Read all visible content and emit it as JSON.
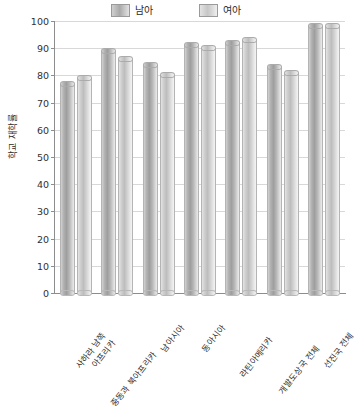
{
  "chart_data": {
    "type": "bar",
    "title": "",
    "xlabel": "",
    "ylabel": "학교 재학률",
    "ylim": [
      0,
      100
    ],
    "yticks": [
      0,
      10,
      20,
      30,
      40,
      50,
      60,
      70,
      80,
      90,
      100
    ],
    "grid": true,
    "legend_position": "top-center",
    "categories": [
      "사하라 남쪽 아프리카",
      "중동과 북아프리카",
      "남아시아",
      "동아시아",
      "라틴아메리카",
      "개발도상국 전체",
      "선진국 전체"
    ],
    "category_lines": [
      [
        "사하라 남쪽",
        "아프리카"
      ],
      [
        "중동과 북아프리카",
        ""
      ],
      [
        "남아시아",
        ""
      ],
      [
        "동아시아",
        ""
      ],
      [
        "라틴아메리카",
        ""
      ],
      [
        "개발도상국 전체",
        ""
      ],
      [
        "선진국 전체",
        ""
      ]
    ],
    "series": [
      {
        "name": "남아",
        "color": "#a9a9a9",
        "values": [
          77,
          89,
          84,
          91,
          92,
          83,
          98
        ]
      },
      {
        "name": "여아",
        "color": "#cdcdcd",
        "values": [
          79,
          86,
          80,
          90,
          93,
          81,
          98
        ]
      }
    ]
  },
  "legend": {
    "items": [
      {
        "label": "남아"
      },
      {
        "label": "여아"
      }
    ]
  }
}
